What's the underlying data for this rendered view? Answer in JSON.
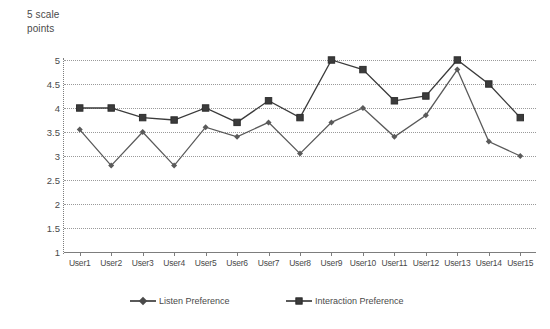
{
  "chart_data": {
    "type": "line",
    "title": "",
    "ylabel": "5 scale\npoints",
    "xlabel": "",
    "ylim": [
      1,
      5
    ],
    "ytick_step": 0.5,
    "yticks": [
      "5",
      "4.5",
      "4",
      "3.5",
      "3",
      "2.5",
      "2",
      "1.5",
      "1"
    ],
    "grid": true,
    "legend_position": "bottom",
    "categories": [
      "User1",
      "User2",
      "User3",
      "User4",
      "User5",
      "User6",
      "User7",
      "User8",
      "User9",
      "User10",
      "User11",
      "User12",
      "User13",
      "User14",
      "User15"
    ],
    "series": [
      {
        "name": "Listen Preference",
        "marker": "diamond",
        "color": "#5a5a5a",
        "values": [
          3.55,
          2.8,
          3.5,
          2.8,
          3.6,
          3.4,
          3.7,
          3.05,
          3.7,
          4.0,
          3.4,
          3.85,
          4.8,
          3.3,
          3.0
        ]
      },
      {
        "name": "Interaction Preference",
        "marker": "square",
        "color": "#3b3b3b",
        "values": [
          4.0,
          4.0,
          3.8,
          3.75,
          4.0,
          3.7,
          4.15,
          3.8,
          5.0,
          4.8,
          4.15,
          4.25,
          5.0,
          4.5,
          3.8
        ]
      }
    ]
  },
  "axis": {
    "y_title": "5 scale\npoints"
  },
  "legend": {
    "items": [
      {
        "label": "Listen Preference"
      },
      {
        "label": "Interaction Preference"
      }
    ]
  }
}
